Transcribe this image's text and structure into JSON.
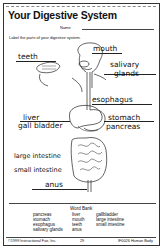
{
  "worksheet": {
    "title": "Your Digestive System",
    "name_label": "Name",
    "instructions": "Label the parts of your digestive system."
  },
  "labels": [
    {
      "text": "teeth",
      "x": 18,
      "y": 52
    },
    {
      "text": "mouth",
      "x": 93,
      "y": 44
    },
    {
      "text": "salivary",
      "x": 110,
      "y": 60
    },
    {
      "text": "glands",
      "x": 114,
      "y": 69
    },
    {
      "text": "esophagus",
      "x": 92,
      "y": 95
    },
    {
      "text": "liver",
      "x": 23,
      "y": 113
    },
    {
      "text": "gall bladder",
      "x": 18,
      "y": 121
    },
    {
      "text": "stomach",
      "x": 108,
      "y": 113
    },
    {
      "text": "pancreas",
      "x": 106,
      "y": 122
    },
    {
      "text": "large intestine",
      "x": 14,
      "y": 152
    },
    {
      "text": "small intestine",
      "x": 14,
      "y": 166
    },
    {
      "text": "anus",
      "x": 45,
      "y": 180
    }
  ],
  "word_bank": {
    "title": "Word Bank",
    "columns": [
      [
        "pancreas",
        "stomach",
        "esophagus",
        "salivary glands"
      ],
      [
        "liver",
        "mouth",
        "teeth",
        "anus"
      ],
      [
        "gallbladder",
        "large intestine",
        "small intestine"
      ]
    ]
  },
  "footer": {
    "copyright": "©1999 Instructional Fair, Inc.",
    "page": "29",
    "product": "IF0026 Human Body"
  }
}
